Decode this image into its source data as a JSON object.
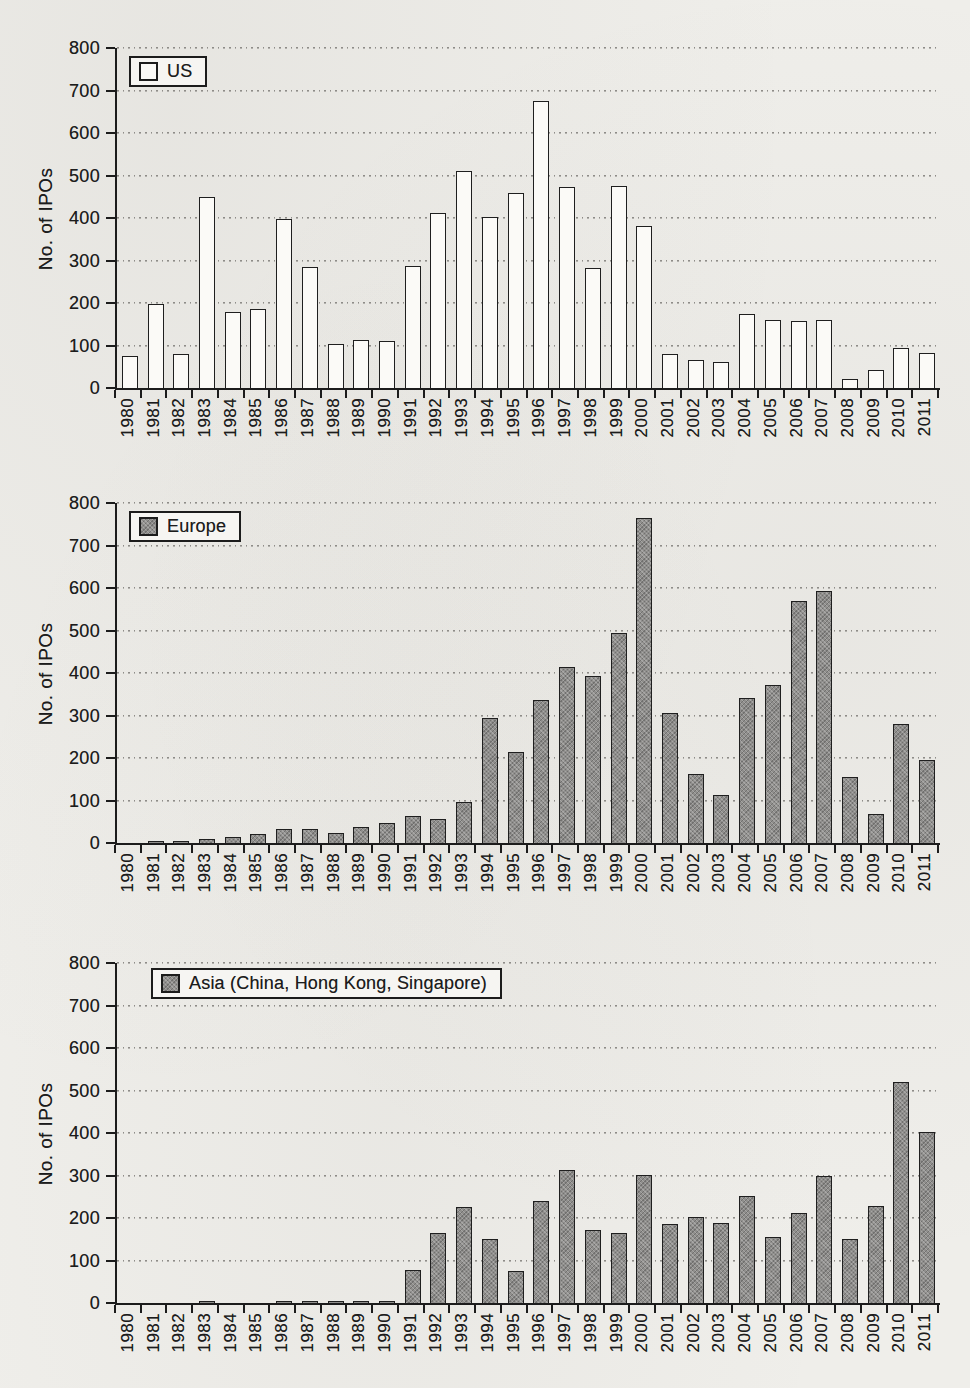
{
  "page": {
    "kind": "scanned-book-figure",
    "paper_color": "#efeeea",
    "ink_color": "#1c1c1c",
    "bar_gray": "#8f8e8c",
    "bar_white": "#fbfaf7"
  },
  "chart_data": [
    {
      "type": "bar",
      "legend": "US",
      "ylabel": "No. of IPOs",
      "ylim": [
        0,
        800
      ],
      "ytick_step": 100,
      "grid": "dotted-horizontal",
      "legend_position": "top-left",
      "bar_fill": "white",
      "categories": [
        "1980",
        "1981",
        "1982",
        "1983",
        "1984",
        "1985",
        "1986",
        "1987",
        "1988",
        "1989",
        "1990",
        "1991",
        "1992",
        "1993",
        "1994",
        "1995",
        "1996",
        "1997",
        "1998",
        "1999",
        "2000",
        "2001",
        "2002",
        "2003",
        "2004",
        "2005",
        "2006",
        "2007",
        "2008",
        "2009",
        "2010",
        "2011"
      ],
      "values": [
        75,
        198,
        80,
        450,
        178,
        185,
        398,
        285,
        103,
        112,
        110,
        287,
        412,
        510,
        403,
        460,
        675,
        474,
        283,
        476,
        380,
        80,
        67,
        62,
        174,
        160,
        158,
        160,
        22,
        42,
        93,
        83
      ]
    },
    {
      "type": "bar",
      "legend": "Europe",
      "ylabel": "No. of IPOs",
      "ylim": [
        0,
        800
      ],
      "ytick_step": 100,
      "grid": "dotted-horizontal",
      "legend_position": "top-left",
      "bar_fill": "gray-hatch",
      "categories": [
        "1980",
        "1981",
        "1982",
        "1983",
        "1984",
        "1985",
        "1986",
        "1987",
        "1988",
        "1989",
        "1990",
        "1991",
        "1992",
        "1993",
        "1994",
        "1995",
        "1996",
        "1997",
        "1998",
        "1999",
        "2000",
        "2001",
        "2002",
        "2003",
        "2004",
        "2005",
        "2006",
        "2007",
        "2008",
        "2009",
        "2010",
        "2011"
      ],
      "values": [
        0,
        5,
        5,
        9,
        13,
        22,
        33,
        32,
        24,
        38,
        47,
        64,
        57,
        96,
        293,
        213,
        337,
        413,
        392,
        494,
        765,
        307,
        163,
        113,
        341,
        372,
        570,
        593,
        155,
        68,
        280,
        195
      ]
    },
    {
      "type": "bar",
      "legend": "Asia (China, Hong Kong, Singapore)",
      "ylabel": "No. of IPOs",
      "ylim": [
        0,
        800
      ],
      "ytick_step": 100,
      "grid": "dotted-horizontal",
      "legend_position": "top-left",
      "bar_fill": "gray-hatch",
      "categories": [
        "1980",
        "1981",
        "1982",
        "1983",
        "1984",
        "1985",
        "1986",
        "1987",
        "1988",
        "1989",
        "1990",
        "1991",
        "1992",
        "1993",
        "1994",
        "1995",
        "1996",
        "1997",
        "1998",
        "1999",
        "2000",
        "2001",
        "2002",
        "2003",
        "2004",
        "2005",
        "2006",
        "2007",
        "2008",
        "2009",
        "2010",
        "2011"
      ],
      "values": [
        0,
        0,
        0,
        3,
        0,
        0,
        3,
        4,
        5,
        4,
        5,
        78,
        165,
        225,
        150,
        76,
        240,
        312,
        172,
        165,
        300,
        185,
        202,
        188,
        252,
        155,
        212,
        298,
        150,
        228,
        520,
        403
      ]
    }
  ]
}
